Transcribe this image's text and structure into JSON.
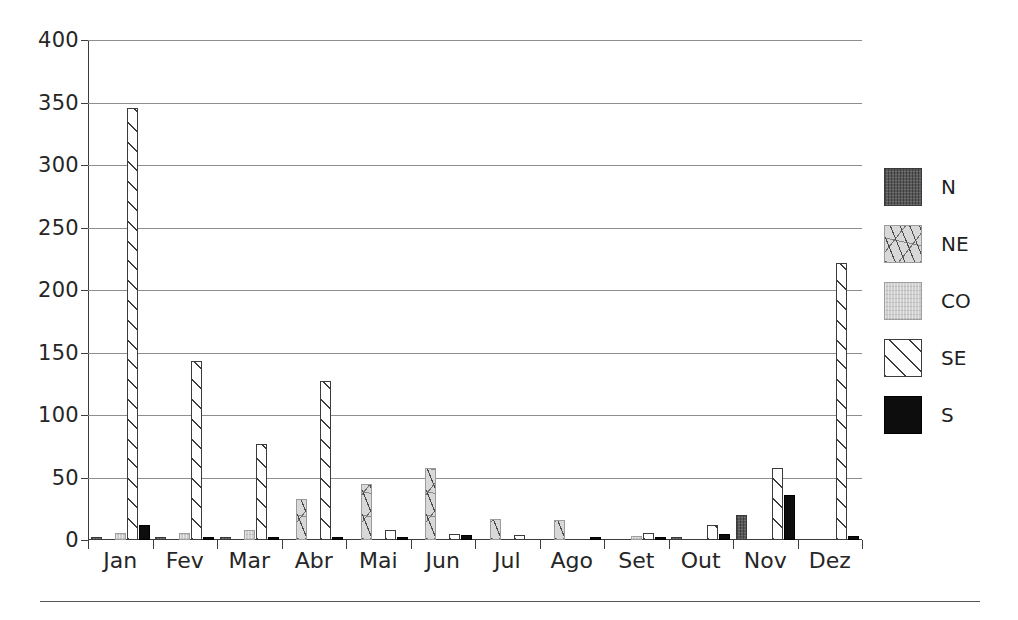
{
  "chart_data": {
    "type": "bar",
    "title": "",
    "subtitle": "",
    "xlabel": "",
    "ylabel": "",
    "ylim": [
      0,
      400
    ],
    "ytick_values": [
      0,
      50,
      100,
      150,
      200,
      250,
      300,
      350,
      400
    ],
    "ytick_labels": [
      "0",
      "50",
      "100",
      "150",
      "200",
      "250",
      "300",
      "350",
      "400"
    ],
    "grid": "horizontal",
    "legend_position": "right",
    "categories": [
      "Jan",
      "Fev",
      "Mar",
      "Abr",
      "Mai",
      "Jun",
      "Jul",
      "Ago",
      "Set",
      "Out",
      "Nov",
      "Dez"
    ],
    "series": [
      {
        "name": "N",
        "fill": "dark-gray-crosshatch",
        "color": "#585858",
        "values": [
          1,
          2,
          2,
          0,
          0,
          0,
          0,
          0,
          0,
          2,
          20,
          0
        ]
      },
      {
        "name": "NE",
        "fill": "light-gray-scattered-dashes",
        "color": "#d8d8d8",
        "values": [
          0,
          0,
          0,
          33,
          45,
          58,
          17,
          16,
          0,
          0,
          0,
          0
        ]
      },
      {
        "name": "CO",
        "fill": "light-gray-solid",
        "color": "#cfcfcf",
        "values": [
          6,
          6,
          8,
          0,
          0,
          0,
          0,
          0,
          3,
          0,
          0,
          0
        ]
      },
      {
        "name": "SE",
        "fill": "white-diagonal-hatch",
        "color": "#ffffff",
        "values": [
          346,
          143,
          77,
          127,
          8,
          5,
          4,
          0,
          6,
          12,
          58,
          222
        ]
      },
      {
        "name": "S",
        "fill": "black-solid",
        "color": "#0d0d0d",
        "values": [
          12,
          2,
          2,
          2,
          2,
          4,
          0,
          2,
          2,
          5,
          36,
          3
        ]
      }
    ]
  },
  "legend": {
    "items": [
      {
        "label": "N"
      },
      {
        "label": "NE"
      },
      {
        "label": "CO"
      },
      {
        "label": "SE"
      },
      {
        "label": "S"
      }
    ]
  }
}
